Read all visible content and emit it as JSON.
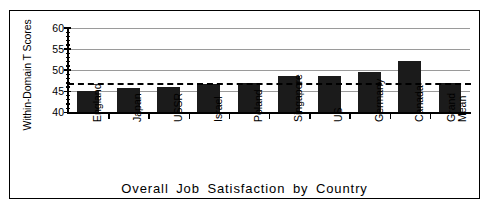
{
  "chart_data": {
    "type": "bar",
    "title": "Overall Job Satisfaction by Country",
    "xlabel": "",
    "ylabel": "Within-Domain T Scores",
    "categories": [
      "England",
      "Japan",
      "USSR",
      "Israel",
      "Poland",
      "Singapore",
      "US",
      "Germany",
      "Canada",
      "Grand Mean"
    ],
    "values": [
      45.0,
      45.8,
      46.0,
      46.8,
      46.9,
      48.6,
      48.7,
      49.6,
      52.3,
      47.0
    ],
    "ylim": [
      40,
      60
    ],
    "yticks": [
      40,
      45,
      50,
      55,
      60
    ],
    "ytick_labels": [
      "40",
      "45",
      "50",
      "55",
      "60"
    ],
    "grid": "horizontal gridlines at 45, 50, 55, 60",
    "legend": "none",
    "reference_line": {
      "label": "Grand Mean",
      "value": 47.0,
      "style": "dashed"
    },
    "bar_color": "#1b1b1b",
    "gridline_color": "#9a9a9a",
    "axis_color": "#000000"
  },
  "figure": {
    "border": "rectangular frame",
    "background": "#ffffff"
  }
}
